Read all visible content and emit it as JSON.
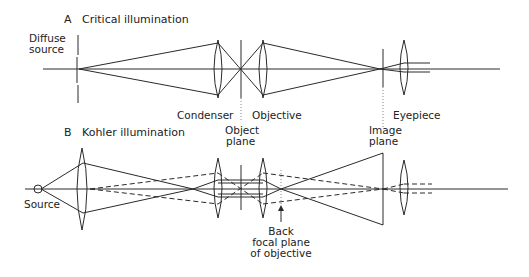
{
  "diagram_a": {
    "letter": "A",
    "title": "Critical illumination",
    "labels": {
      "source_line1": "Diffuse",
      "source_line2": "source",
      "condenser": "Condenser",
      "objective": "Objective",
      "eyepiece": "Eyepiece",
      "object_plane_line1": "Object",
      "object_plane_line2": "plane",
      "image_plane_line1": "Image",
      "image_plane_line2": "plane"
    }
  },
  "diagram_b": {
    "letter": "B",
    "title": "Kohler illumination",
    "labels": {
      "source": "Source",
      "back_focal_line1": "Back",
      "back_focal_line2": "focal plane",
      "back_focal_line3": "of objective"
    }
  },
  "colors": {
    "line": "#2a2a2a",
    "text": "#222222",
    "background": "#ffffff"
  }
}
